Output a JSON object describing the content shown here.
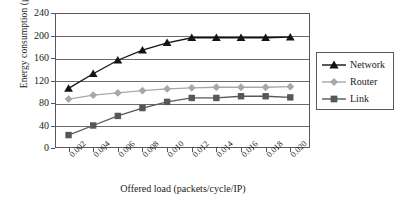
{
  "chart_data": {
    "type": "line",
    "title": "",
    "xlabel": "Offered load (packets/cycle/IP)",
    "ylabel": "Energy consumption (μJ)",
    "x": [
      0.002,
      0.004,
      0.006,
      0.008,
      0.01,
      0.012,
      0.014,
      0.016,
      0.018,
      0.02
    ],
    "xticklabels": [
      "0.002",
      "0.004",
      "0.006",
      "0.008",
      "0.010",
      "0.012",
      "0.014",
      "0.016",
      "0.018",
      "0.020"
    ],
    "yticklabels": [
      "240",
      "200",
      "160",
      "120",
      "80",
      "40",
      "0"
    ],
    "ylim": [
      0,
      240
    ],
    "ytick_step": 40,
    "grid": "horizontal",
    "legend_position": "right",
    "series": [
      {
        "name": "Network",
        "marker": "triangle",
        "color": "#141414",
        "values": [
          106,
          132,
          156,
          174,
          187,
          196,
          196,
          196,
          196,
          197
        ]
      },
      {
        "name": "Router",
        "marker": "diamond",
        "color": "#a8a8a8",
        "values": [
          87,
          94,
          98,
          102,
          105,
          107,
          108,
          108,
          108,
          109
        ]
      },
      {
        "name": "Link",
        "marker": "square",
        "color": "#575757",
        "values": [
          23,
          40,
          57,
          71,
          82,
          89,
          89,
          92,
          92,
          90
        ]
      }
    ]
  }
}
